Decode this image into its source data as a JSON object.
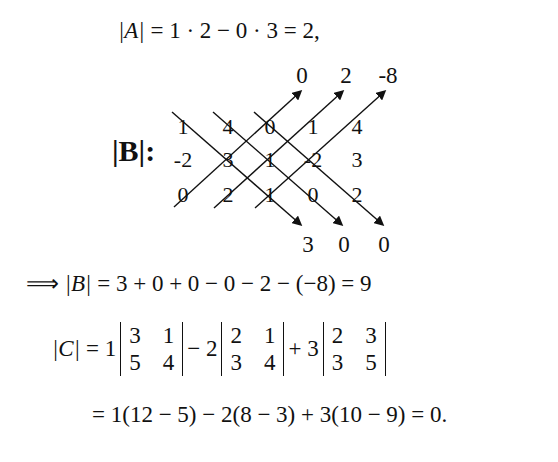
{
  "eq_A": {
    "lhs": "|A|",
    "rhs": "= 1 · 2 − 0 · 3 = 2,"
  },
  "sarrus": {
    "label": "|B|:",
    "matrix_rows": [
      [
        "1",
        "4",
        "0",
        "1",
        "4"
      ],
      [
        "-2",
        "3",
        "1",
        "-2",
        "3"
      ],
      [
        "0",
        "2",
        "1",
        "0",
        "2"
      ]
    ],
    "up_products": [
      "0",
      "2",
      "-8"
    ],
    "down_products": [
      "3",
      "0",
      "0"
    ]
  },
  "eq_B": {
    "implies": "⟹",
    "lhs": "|B|",
    "rhs": "= 3 + 0 + 0 − 0 − 2 − (−8) = 9"
  },
  "eq_C": {
    "lhs": "|C|",
    "eq": "= 1",
    "term1": {
      "rows": [
        [
          "3",
          "1"
        ],
        [
          "5",
          "4"
        ]
      ]
    },
    "op2": "− 2",
    "term2": {
      "rows": [
        [
          "2",
          "1"
        ],
        [
          "3",
          "4"
        ]
      ]
    },
    "op3": "+ 3",
    "term3": {
      "rows": [
        [
          "2",
          "3"
        ],
        [
          "3",
          "5"
        ]
      ]
    },
    "line2": "= 1(12 − 5) − 2(8 − 3) + 3(10 − 9) = 0."
  }
}
